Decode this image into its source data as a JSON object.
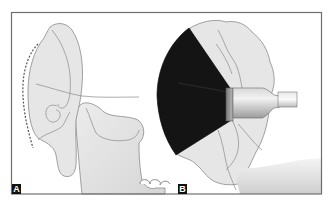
{
  "figure": {
    "panels": [
      {
        "id": "A",
        "label": "A"
      },
      {
        "id": "B",
        "label": "B"
      }
    ],
    "colors": {
      "frame": "#6e6e6e",
      "background": "#ffffff",
      "tissue_fill": "#e6e6e6",
      "tissue_stroke": "#8a8a8a",
      "ultrasound_beam": "#141414",
      "probe_light": "#efefef",
      "probe_dark": "#9a9a9a",
      "label_bg": "#111111",
      "label_text": "#ffffff"
    }
  }
}
